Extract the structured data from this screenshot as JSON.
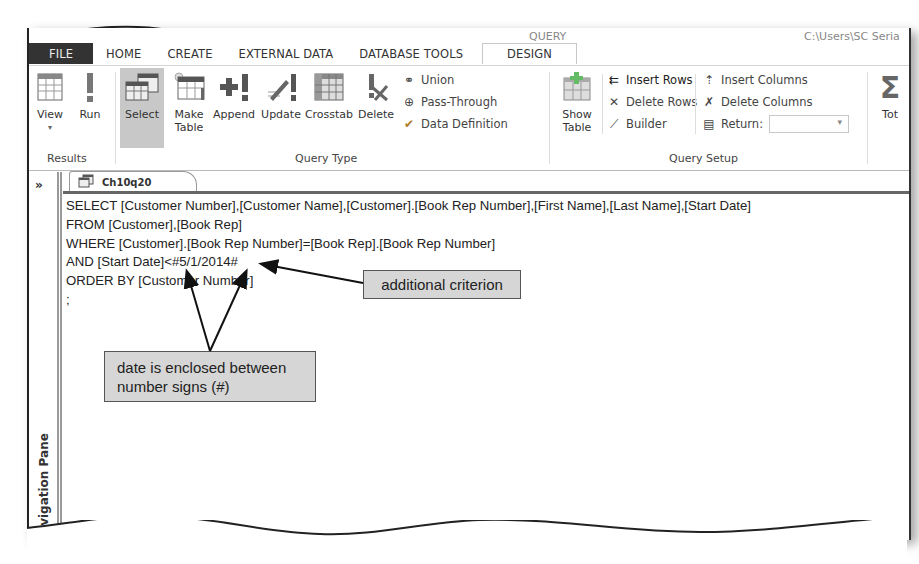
{
  "titlebar": {
    "fragment_left": "QUERY",
    "fragment_right": "C:\\Users\\SC Seria"
  },
  "ribbon_tabs": [
    {
      "label": "FILE"
    },
    {
      "label": "HOME"
    },
    {
      "label": "CREATE"
    },
    {
      "label": "EXTERNAL DATA"
    },
    {
      "label": "DATABASE TOOLS"
    },
    {
      "label": "DESIGN",
      "active": true
    }
  ],
  "ribbon": {
    "results": {
      "label": "Results",
      "view": "View",
      "run": "Run"
    },
    "query_type": {
      "label": "Query Type",
      "select": "Select",
      "make_table_1": "Make",
      "make_table_2": "Table",
      "append": "Append",
      "update": "Update",
      "crosstab": "Crosstab",
      "delete": "Delete",
      "union": "Union",
      "pass_through": "Pass-Through",
      "data_definition": "Data Definition"
    },
    "query_setup": {
      "label": "Query Setup",
      "show_table_1": "Show",
      "show_table_2": "Table",
      "insert_rows": "Insert Rows",
      "delete_rows": "Delete Rows",
      "builder": "Builder",
      "insert_columns": "Insert Columns",
      "delete_columns": "Delete Columns",
      "return": "Return:",
      "return_value": ""
    },
    "totals": "Tot"
  },
  "nav_pane": {
    "toggle": "»",
    "label": "Navigation Pane"
  },
  "document_tab": {
    "label": "Ch10q20"
  },
  "sql_lines": [
    "SELECT [Customer Number],[Customer Name],[Customer].[Book Rep Number],[First Name],[Last Name],[Start Date]",
    "FROM [Customer],[Book Rep]",
    "WHERE [Customer].[Book Rep Number]=[Book Rep].[Book Rep Number]",
    "AND [Start Date]<#5/1/2014#",
    "ORDER BY [Customer Number]",
    ";"
  ],
  "callouts": {
    "criterion": "additional criterion",
    "date_line1": "date is enclosed between",
    "date_line2": "number signs (#)"
  }
}
